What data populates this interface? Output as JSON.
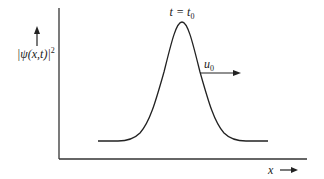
{
  "figure": {
    "type": "wave-packet-diagram",
    "y_axis_label": "|ψ(x,t)|",
    "y_axis_label_sup": "2",
    "x_axis_label": "x",
    "time_label_left": "t = t",
    "time_label_sub": "0",
    "velocity_label": "u",
    "velocity_label_sub": "0",
    "colors": {
      "line": "#222222",
      "background": "#ffffff"
    }
  }
}
